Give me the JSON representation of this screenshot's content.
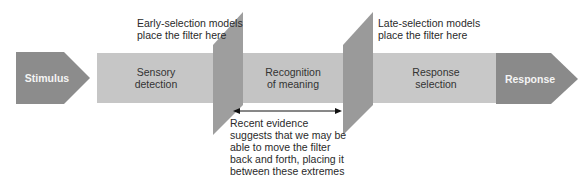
{
  "diagram": {
    "stages": {
      "stimulus": "Stimulus",
      "sensory_line1": "Sensory",
      "sensory_line2": "detection",
      "recognition_line1": "Recognition",
      "recognition_line2": "of meaning",
      "response_selection_line1": "Response",
      "response_selection_line2": "selection",
      "response": "Response"
    },
    "annotations": {
      "early_line1": "Early-selection models",
      "early_line2": "place the filter here",
      "late_line1": "Late-selection models",
      "late_line2": "place the filter here",
      "recent": [
        "Recent evidence",
        "suggests that we may be",
        "able to move the filter",
        "back and forth, placing it",
        "between these extremes"
      ]
    },
    "colors": {
      "end_boxes": "#8a8a8a",
      "stage_boxes": "#c4c4c4",
      "filter": "#9c9c9c",
      "arrow": "#111111"
    }
  }
}
